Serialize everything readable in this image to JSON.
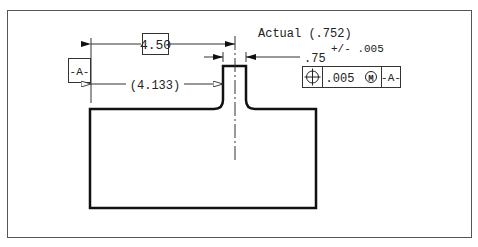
{
  "drawing": {
    "datum_label": "-A-",
    "basic_dim": "4.50",
    "ref_dim": "(4.133)",
    "actual_label": "Actual (.752)",
    "width_dim": ".75",
    "tolerance": "+/- .005",
    "fcf": {
      "symbol": "position",
      "tolerance": ".005",
      "modifier": "M",
      "datum": "-A-"
    }
  },
  "colors": {
    "line": "#111111",
    "thin": "#333333",
    "frame": "#555555"
  }
}
